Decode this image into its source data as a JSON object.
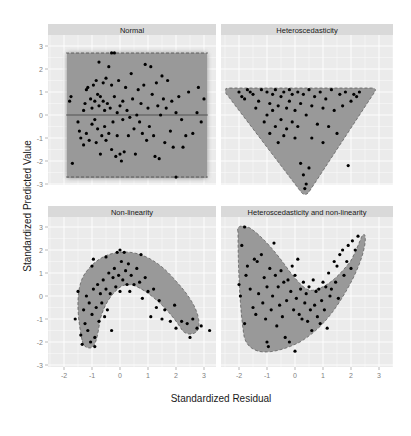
{
  "chart_data": {
    "type": "scatter",
    "layout": "facet_grid_2x2",
    "xlabel": "Standardized Residual",
    "ylabel": "Standardized Predicted Value",
    "xlim": [
      -2.3,
      3.3
    ],
    "ylim": [
      -3.6,
      3.4
    ],
    "xticks": [
      -2,
      -1,
      0,
      1,
      2,
      3
    ],
    "yticks": [
      3,
      2,
      1,
      0,
      -1,
      -2,
      -3
    ],
    "grid": true,
    "legend": null,
    "colors": {
      "panel_bg": "#ebebeb",
      "strip_bg": "#d9d9d9",
      "points": "#000000",
      "region_fill": "#9a9a9a",
      "region_outline": "#555555"
    },
    "panels": [
      {
        "title": "Normal",
        "region": "rectangle from x=-1.9 to 3.1, y=-2.7 to 2.7 with solid line at y=0",
        "points": [
          [
            -1.8,
            0.6
          ],
          [
            -1.75,
            0.8
          ],
          [
            -1.7,
            -2.1
          ],
          [
            -1.5,
            -0.3
          ],
          [
            -1.45,
            -0.7
          ],
          [
            -1.4,
            -1.0
          ],
          [
            -1.3,
            0.2
          ],
          [
            -1.3,
            -1.3
          ],
          [
            -1.25,
            0.5
          ],
          [
            -1.2,
            -0.8
          ],
          [
            -1.2,
            1.1
          ],
          [
            -1.15,
            1.2
          ],
          [
            -1.1,
            -1.1
          ],
          [
            -1.05,
            0.7
          ],
          [
            -1.0,
            -0.4
          ],
          [
            -1.0,
            0.3
          ],
          [
            -0.95,
            1.3
          ],
          [
            -0.9,
            -0.2
          ],
          [
            -0.9,
            0.6
          ],
          [
            -0.85,
            -1.2
          ],
          [
            -0.85,
            1.5
          ],
          [
            -0.8,
            0.9
          ],
          [
            -0.8,
            -0.6
          ],
          [
            -0.75,
            0.4
          ],
          [
            -0.75,
            2.3
          ],
          [
            -0.7,
            -1.7
          ],
          [
            -0.7,
            0.8
          ],
          [
            -0.65,
            -0.9
          ],
          [
            -0.6,
            0.6
          ],
          [
            -0.6,
            1.4
          ],
          [
            -0.55,
            -0.5
          ],
          [
            -0.55,
            0.2
          ],
          [
            -0.5,
            1.6
          ],
          [
            -0.5,
            -1.1
          ],
          [
            -0.45,
            0.5
          ],
          [
            -0.4,
            2.1
          ],
          [
            -0.4,
            -0.8
          ],
          [
            -0.35,
            0.3
          ],
          [
            -0.3,
            1.3
          ],
          [
            -0.3,
            -1.5
          ],
          [
            -0.25,
            -0.3
          ],
          [
            -0.2,
            0.8
          ],
          [
            -0.2,
            2.7
          ],
          [
            -0.15,
            -1.8
          ],
          [
            -0.1,
            0.1
          ],
          [
            -0.1,
            -0.9
          ],
          [
            -0.05,
            1.5
          ],
          [
            0.0,
            -1.7
          ],
          [
            0.0,
            0.4
          ],
          [
            0.05,
            -2.0
          ],
          [
            0.1,
            -0.2
          ],
          [
            0.1,
            0.6
          ],
          [
            0.15,
            -1.6
          ],
          [
            0.2,
            1.2
          ],
          [
            0.25,
            0.2
          ],
          [
            0.3,
            -0.9
          ],
          [
            0.35,
            -0.1
          ],
          [
            0.4,
            1.8
          ],
          [
            0.45,
            0.7
          ],
          [
            0.5,
            -0.6
          ],
          [
            0.55,
            -1.7
          ],
          [
            0.6,
            0.0
          ],
          [
            0.65,
            1.1
          ],
          [
            0.7,
            -0.3
          ],
          [
            0.75,
            0.5
          ],
          [
            0.8,
            -0.8
          ],
          [
            0.85,
            1.3
          ],
          [
            0.9,
            2.2
          ],
          [
            0.95,
            -1.1
          ],
          [
            1.0,
            0.3
          ],
          [
            1.05,
            -0.5
          ],
          [
            1.1,
            2.1
          ],
          [
            1.15,
            0.9
          ],
          [
            1.2,
            -0.9
          ],
          [
            1.25,
            -1.8
          ],
          [
            1.3,
            1.4
          ],
          [
            1.35,
            0.4
          ],
          [
            1.4,
            -1.9
          ],
          [
            1.45,
            0.0
          ],
          [
            1.5,
            1.7
          ],
          [
            1.55,
            0.7
          ],
          [
            1.6,
            -1.2
          ],
          [
            1.65,
            0.3
          ],
          [
            1.7,
            1.5
          ],
          [
            1.8,
            -0.7
          ],
          [
            1.85,
            0.6
          ],
          [
            1.9,
            -1.4
          ],
          [
            2.0,
            0.1
          ],
          [
            2.0,
            -2.7
          ],
          [
            2.1,
            0.8
          ],
          [
            2.25,
            -1.4
          ],
          [
            2.35,
            -0.9
          ],
          [
            2.45,
            1.0
          ],
          [
            2.6,
            -0.8
          ],
          [
            2.75,
            0.1
          ],
          [
            2.8,
            1.2
          ],
          [
            2.9,
            -0.3
          ],
          [
            3.0,
            0.7
          ],
          [
            2.2,
            -0.2
          ],
          [
            -0.3,
            2.7
          ]
        ]
      },
      {
        "title": "Heteroscedasticity",
        "region": "inverted triangle from (-2.1,1.1) to (2.3,1.1) down to (0.3,-3.3)",
        "points": [
          [
            -2.0,
            1.0
          ],
          [
            -1.9,
            0.8
          ],
          [
            -1.8,
            0.7
          ],
          [
            -1.7,
            1.1
          ],
          [
            -1.6,
            1.0
          ],
          [
            -1.5,
            0.9
          ],
          [
            -1.4,
            0.3
          ],
          [
            -1.3,
            0.6
          ],
          [
            -1.2,
            1.1
          ],
          [
            -1.1,
            -0.3
          ],
          [
            -1.0,
            0.0
          ],
          [
            -1.0,
            1.0
          ],
          [
            -0.9,
            0.5
          ],
          [
            -0.9,
            -0.8
          ],
          [
            -0.8,
            0.2
          ],
          [
            -0.8,
            0.9
          ],
          [
            -0.7,
            1.1
          ],
          [
            -0.7,
            -0.5
          ],
          [
            -0.6,
            0.4
          ],
          [
            -0.6,
            -1.2
          ],
          [
            -0.5,
            0.8
          ],
          [
            -0.5,
            -0.2
          ],
          [
            -0.4,
            1.0
          ],
          [
            -0.4,
            -0.9
          ],
          [
            -0.3,
            0.3
          ],
          [
            -0.3,
            -0.6
          ],
          [
            -0.2,
            1.1
          ],
          [
            -0.2,
            0.6
          ],
          [
            -0.1,
            -0.3
          ],
          [
            -0.1,
            0.9
          ],
          [
            0.0,
            0.2
          ],
          [
            0.0,
            -1.0
          ],
          [
            0.1,
            1.0
          ],
          [
            0.1,
            -0.5
          ],
          [
            0.2,
            0.5
          ],
          [
            0.2,
            -2.1
          ],
          [
            0.3,
            0.9
          ],
          [
            0.3,
            -2.6
          ],
          [
            0.35,
            -3.2
          ],
          [
            0.4,
            0.0
          ],
          [
            0.4,
            -3.0
          ],
          [
            0.5,
            1.1
          ],
          [
            0.5,
            -2.3
          ],
          [
            0.6,
            0.4
          ],
          [
            0.6,
            -1.0
          ],
          [
            0.7,
            0.8
          ],
          [
            0.8,
            -0.4
          ],
          [
            0.9,
            1.0
          ],
          [
            1.0,
            0.3
          ],
          [
            1.0,
            -1.2
          ],
          [
            1.1,
            0.7
          ],
          [
            1.2,
            -0.5
          ],
          [
            1.3,
            1.1
          ],
          [
            1.4,
            0.2
          ],
          [
            1.5,
            -0.8
          ],
          [
            1.6,
            0.9
          ],
          [
            1.7,
            0.4
          ],
          [
            1.8,
            1.0
          ],
          [
            1.9,
            -2.2
          ],
          [
            2.0,
            0.6
          ],
          [
            2.1,
            0.9
          ],
          [
            2.2,
            0.8
          ],
          [
            2.3,
            1.0
          ]
        ]
      },
      {
        "title": "Non-linearity",
        "region": "arch-shaped band from (-1.4,-2.2) rising to (0.0,1.6) then descending to (2.8,-1.8)",
        "points": [
          [
            -1.6,
            -1.0
          ],
          [
            -1.5,
            0.2
          ],
          [
            -1.4,
            -1.7
          ],
          [
            -1.35,
            -2.1
          ],
          [
            -1.3,
            -0.6
          ],
          [
            -1.25,
            -1.2
          ],
          [
            -1.2,
            0.0
          ],
          [
            -1.15,
            -1.5
          ],
          [
            -1.1,
            -0.3
          ],
          [
            -1.05,
            -2.0
          ],
          [
            -1.0,
            -0.8
          ],
          [
            -1.0,
            1.3
          ],
          [
            -0.95,
            0.3
          ],
          [
            -0.95,
            1.6
          ],
          [
            -0.9,
            -1.8
          ],
          [
            -0.9,
            -2.2
          ],
          [
            -0.85,
            -0.5
          ],
          [
            -0.8,
            0.5
          ],
          [
            -0.75,
            -1.1
          ],
          [
            -0.7,
            0.1
          ],
          [
            -0.65,
            -0.3
          ],
          [
            -0.6,
            0.7
          ],
          [
            -0.55,
            -0.9
          ],
          [
            -0.5,
            1.7
          ],
          [
            -0.5,
            0.3
          ],
          [
            -0.45,
            -0.6
          ],
          [
            -0.4,
            1.0
          ],
          [
            -0.35,
            0.1
          ],
          [
            -0.3,
            -1.5
          ],
          [
            -0.25,
            0.8
          ],
          [
            -0.2,
            1.2
          ],
          [
            -0.15,
            0.4
          ],
          [
            -0.1,
            1.9
          ],
          [
            -0.05,
            0.9
          ],
          [
            0.0,
            2.0
          ],
          [
            0.0,
            0.2
          ],
          [
            0.05,
            1.5
          ],
          [
            0.1,
            0.7
          ],
          [
            0.15,
            1.9
          ],
          [
            0.2,
            1.1
          ],
          [
            0.25,
            0.5
          ],
          [
            0.3,
            1.4
          ],
          [
            0.35,
            0.2
          ],
          [
            0.4,
            0.9
          ],
          [
            0.5,
            0.5
          ],
          [
            0.6,
            1.2
          ],
          [
            0.7,
            0.6
          ],
          [
            0.75,
            1.8
          ],
          [
            0.8,
            -0.1
          ],
          [
            0.9,
            0.8
          ],
          [
            1.0,
            0.2
          ],
          [
            1.1,
            -0.9
          ],
          [
            1.2,
            0.3
          ],
          [
            1.3,
            -0.5
          ],
          [
            1.4,
            -0.2
          ],
          [
            1.5,
            -1.0
          ],
          [
            1.6,
            -0.6
          ],
          [
            1.8,
            -1.1
          ],
          [
            1.95,
            -0.4
          ],
          [
            2.0,
            -1.4
          ],
          [
            2.2,
            -1.1
          ],
          [
            2.4,
            -1.2
          ],
          [
            2.5,
            -1.8
          ],
          [
            2.6,
            -1.0
          ],
          [
            2.75,
            -1.4
          ],
          [
            2.9,
            -1.3
          ],
          [
            3.2,
            -1.5
          ]
        ]
      },
      {
        "title": "Heteroscedasticity and non-linearity",
        "region": "V/boomerang-shaped region: left lobe from (-2.0,3.0) down to (-1.0,-2.3), right arm rising to (2.3,2.6)",
        "points": [
          [
            -1.8,
            3.0
          ],
          [
            -1.9,
            2.2
          ],
          [
            -2.0,
            0.5
          ],
          [
            -1.95,
            0.0
          ],
          [
            -1.8,
            -1.2
          ],
          [
            -1.75,
            0.9
          ],
          [
            -1.7,
            1.3
          ],
          [
            -1.6,
            0.3
          ],
          [
            -1.5,
            -0.5
          ],
          [
            -1.45,
            1.6
          ],
          [
            -1.4,
            -0.8
          ],
          [
            -1.35,
            1.5
          ],
          [
            -1.3,
            0.1
          ],
          [
            -1.2,
            1.8
          ],
          [
            -1.15,
            -0.3
          ],
          [
            -1.1,
            0.8
          ],
          [
            -1.05,
            -1.0
          ],
          [
            -1.0,
            -2.0
          ],
          [
            -1.0,
            0.4
          ],
          [
            -0.95,
            -2.2
          ],
          [
            -0.9,
            1.2
          ],
          [
            -0.85,
            -0.6
          ],
          [
            -0.8,
            0.0
          ],
          [
            -0.75,
            2.3
          ],
          [
            -0.7,
            0.9
          ],
          [
            -0.65,
            -1.3
          ],
          [
            -0.6,
            0.4
          ],
          [
            -0.55,
            -0.4
          ],
          [
            -0.5,
            1.1
          ],
          [
            -0.45,
            -0.9
          ],
          [
            -0.4,
            0.6
          ],
          [
            -0.35,
            -1.8
          ],
          [
            -0.3,
            -0.2
          ],
          [
            -0.25,
            0.7
          ],
          [
            -0.2,
            -2.0
          ],
          [
            -0.15,
            0.2
          ],
          [
            -0.1,
            1.3
          ],
          [
            -0.05,
            -0.6
          ],
          [
            0.0,
            0.9
          ],
          [
            0.0,
            -2.4
          ],
          [
            0.05,
            -0.1
          ],
          [
            0.1,
            1.6
          ],
          [
            0.15,
            -0.8
          ],
          [
            0.2,
            0.3
          ],
          [
            0.25,
            -1.0
          ],
          [
            0.3,
            0.6
          ],
          [
            0.35,
            -0.3
          ],
          [
            0.4,
            0.1
          ],
          [
            0.45,
            -1.1
          ],
          [
            0.5,
            0.4
          ],
          [
            0.55,
            -0.6
          ],
          [
            0.6,
            -1.5
          ],
          [
            0.65,
            0.7
          ],
          [
            0.7,
            -0.4
          ],
          [
            0.75,
            0.2
          ],
          [
            0.8,
            -0.9
          ],
          [
            0.85,
            0.3
          ],
          [
            0.9,
            -1.2
          ],
          [
            0.95,
            -0.2
          ],
          [
            1.0,
            0.6
          ],
          [
            1.05,
            -0.6
          ],
          [
            1.1,
            0.4
          ],
          [
            1.15,
            -1.4
          ],
          [
            1.2,
            1.0
          ],
          [
            1.25,
            0.0
          ],
          [
            1.3,
            0.3
          ],
          [
            1.4,
            1.5
          ],
          [
            1.45,
            0.6
          ],
          [
            1.5,
            1.3
          ],
          [
            1.55,
            -0.1
          ],
          [
            1.6,
            1.8
          ],
          [
            1.7,
            2.0
          ],
          [
            1.75,
            0.9
          ],
          [
            1.85,
            1.5
          ],
          [
            1.9,
            2.2
          ],
          [
            2.0,
            1.2
          ],
          [
            2.05,
            2.4
          ],
          [
            2.15,
            2.0
          ],
          [
            2.25,
            2.6
          ]
        ]
      }
    ]
  }
}
